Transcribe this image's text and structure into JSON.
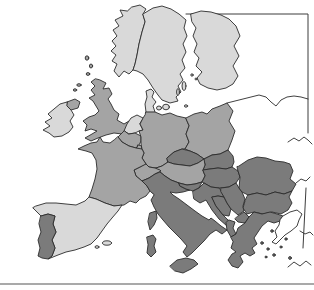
{
  "map": {
    "description": "Grayscale choropleth map of Europe with countries shaded in three gray tones, partial neatline frame at top right and right edge, and a thin horizontal rule at the bottom",
    "background_color": "#ffffff",
    "palette": {
      "light": "#d9d9d9",
      "medium": "#a4a4a4",
      "dark": "#7b7b7b",
      "white": "#ffffff",
      "outline": "#2b2b2b",
      "frame": "#3c3c3c",
      "bottom_rule": "#a9a9a9"
    },
    "regions": [
      {
        "id": "norway",
        "shade": "light"
      },
      {
        "id": "sweden",
        "shade": "light"
      },
      {
        "id": "finland",
        "shade": "light"
      },
      {
        "id": "denmark",
        "shade": "light"
      },
      {
        "id": "denmark-funen",
        "shade": "light"
      },
      {
        "id": "denmark-zealand",
        "shade": "light"
      },
      {
        "id": "bornholm",
        "shade": "light"
      },
      {
        "id": "gotland",
        "shade": "light"
      },
      {
        "id": "oland",
        "shade": "light"
      },
      {
        "id": "aland-islands",
        "shade": "light"
      },
      {
        "id": "ireland",
        "shade": "light"
      },
      {
        "id": "netherlands",
        "shade": "light"
      },
      {
        "id": "spain",
        "shade": "light"
      },
      {
        "id": "mallorca",
        "shade": "light"
      },
      {
        "id": "ibiza",
        "shade": "light"
      },
      {
        "id": "united-kingdom",
        "shade": "medium"
      },
      {
        "id": "northern-ireland",
        "shade": "medium"
      },
      {
        "id": "orkney-shetland",
        "shade": "medium"
      },
      {
        "id": "hebrides",
        "shade": "medium"
      },
      {
        "id": "france",
        "shade": "medium"
      },
      {
        "id": "belgium",
        "shade": "medium"
      },
      {
        "id": "luxembourg",
        "shade": "medium"
      },
      {
        "id": "germany",
        "shade": "medium"
      },
      {
        "id": "poland",
        "shade": "medium"
      },
      {
        "id": "austria",
        "shade": "medium"
      },
      {
        "id": "switzerland",
        "shade": "medium"
      },
      {
        "id": "portugal",
        "shade": "dark"
      },
      {
        "id": "italy",
        "shade": "dark"
      },
      {
        "id": "sicily",
        "shade": "dark"
      },
      {
        "id": "sardinia",
        "shade": "dark"
      },
      {
        "id": "corsica",
        "shade": "dark"
      },
      {
        "id": "czech-republic",
        "shade": "dark"
      },
      {
        "id": "slovakia",
        "shade": "dark"
      },
      {
        "id": "hungary",
        "shade": "dark"
      },
      {
        "id": "slovenia",
        "shade": "dark"
      },
      {
        "id": "croatia",
        "shade": "dark"
      },
      {
        "id": "bosnia-herzegovina",
        "shade": "dark"
      },
      {
        "id": "serbia",
        "shade": "dark"
      },
      {
        "id": "macedonia",
        "shade": "dark"
      },
      {
        "id": "albania",
        "shade": "dark"
      },
      {
        "id": "romania",
        "shade": "dark"
      },
      {
        "id": "bulgaria",
        "shade": "dark"
      },
      {
        "id": "greece",
        "shade": "dark"
      },
      {
        "id": "greek-islands",
        "shade": "dark"
      },
      {
        "id": "turkey-europe",
        "shade": "white"
      }
    ]
  }
}
